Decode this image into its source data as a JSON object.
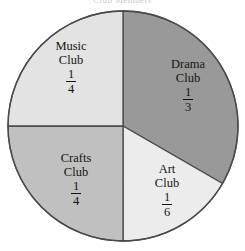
{
  "chart_data": {
    "type": "pie",
    "title": "Club Members",
    "categories": [
      "Drama Club",
      "Art Club",
      "Crafts Club",
      "Music Club"
    ],
    "values": [
      0.3333333333,
      0.1666666667,
      0.25,
      0.25
    ],
    "value_labels": [
      "1/3",
      "1/6",
      "1/4",
      "1/4"
    ],
    "xlabel": "",
    "ylabel": "",
    "legend": "none",
    "grid": false,
    "start_angle_deg": 0,
    "direction": "clockwise",
    "slices": [
      {
        "name": "Drama Club",
        "line1": "Drama",
        "line2": "Club",
        "numerator": "1",
        "denominator": "3",
        "fraction": "1/3",
        "value": 0.3333333333,
        "percent": "33.3%",
        "start_deg": 0,
        "end_deg": 120,
        "color": "#999999"
      },
      {
        "name": "Art Club",
        "line1": "Art",
        "line2": "Club",
        "numerator": "1",
        "denominator": "6",
        "fraction": "1/6",
        "value": 0.1666666667,
        "percent": "16.7%",
        "start_deg": 120,
        "end_deg": 180,
        "color": "#ececec"
      },
      {
        "name": "Crafts Club",
        "line1": "Crafts",
        "line2": "Club",
        "numerator": "1",
        "denominator": "4",
        "fraction": "1/4",
        "value": 0.25,
        "percent": "25%",
        "start_deg": 180,
        "end_deg": 270,
        "color": "#c0c0c0"
      },
      {
        "name": "Music Club",
        "line1": "Music",
        "line2": "Club",
        "numerator": "1",
        "denominator": "4",
        "fraction": "1/4",
        "value": 0.25,
        "percent": "25%",
        "start_deg": 270,
        "end_deg": 360,
        "color": "#e3e3e3"
      }
    ],
    "geometry": {
      "center_x": 123,
      "center_y": 126,
      "radius": 115
    },
    "colors": {
      "outline": "#4a4a4a",
      "background": "#ffffff",
      "text": "#17140f"
    }
  }
}
